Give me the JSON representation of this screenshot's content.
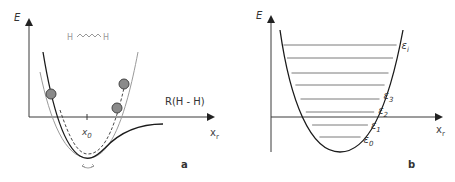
{
  "panels": [
    {
      "id": "a",
      "panel_label": "a",
      "y_axis_label": "E",
      "x_axis_label": "x",
      "x_axis_subscript": "r",
      "molecule_left": "H",
      "molecule_right": "H",
      "curve_label": "R(H - H)",
      "equilibrium_label": "x",
      "equilibrium_subscript": "0",
      "colors": {
        "axis": "#3a3a3a",
        "morse_curve": "#1a1a1a",
        "harmonic_curve": "#9a9a9a",
        "dashed_curve": "#333333",
        "ball_fill": "#8a8a8a",
        "ball_stroke": "#444444",
        "molecule_text": "#9a9a9a"
      }
    },
    {
      "id": "b",
      "panel_label": "b",
      "y_axis_label": "E",
      "x_axis_label": "x",
      "x_axis_subscript": "r",
      "energy_levels": [
        {
          "label": "ε",
          "subscript": "0"
        },
        {
          "label": "ε",
          "subscript": "1"
        },
        {
          "label": "ε",
          "subscript": "2"
        },
        {
          "label": "ε",
          "subscript": "3"
        },
        {
          "label": "",
          "subscript": ""
        },
        {
          "label": "",
          "subscript": ""
        },
        {
          "label": "",
          "subscript": ""
        },
        {
          "label": "ε",
          "subscript": "i"
        }
      ],
      "colors": {
        "axis": "#3a3a3a",
        "parabola": "#1a1a1a",
        "level_line": "#7a7a7a"
      }
    }
  ]
}
